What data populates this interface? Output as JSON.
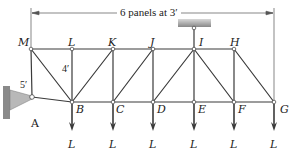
{
  "figure": {
    "type": "truss",
    "dimension_label": "6 panels at 3′",
    "panel_height_label": "4′",
    "left_height_label": "5′",
    "load_label": "L",
    "colors": {
      "member": "#3a3a3a",
      "support": "#9a9a9a",
      "background": "#ffffff"
    }
  },
  "nodes": {
    "M": {
      "label": "M",
      "x": 31,
      "y": 49
    },
    "L": {
      "label": "L",
      "x": 72,
      "y": 49
    },
    "K": {
      "label": "K",
      "x": 113,
      "y": 49
    },
    "J": {
      "label": "J",
      "x": 153,
      "y": 49
    },
    "I": {
      "label": "I",
      "x": 194,
      "y": 49
    },
    "H": {
      "label": "H",
      "x": 234,
      "y": 49
    },
    "A": {
      "label": "A",
      "x": 32,
      "y": 97
    },
    "B": {
      "label": "B",
      "x": 72,
      "y": 102
    },
    "C": {
      "label": "C",
      "x": 113,
      "y": 102
    },
    "D": {
      "label": "D",
      "x": 153,
      "y": 102
    },
    "E": {
      "label": "E",
      "x": 194,
      "y": 102
    },
    "F": {
      "label": "F",
      "x": 234,
      "y": 102
    },
    "G": {
      "label": "G",
      "x": 274,
      "y": 102
    }
  },
  "members": [
    [
      "M",
      "L"
    ],
    [
      "L",
      "K"
    ],
    [
      "K",
      "J"
    ],
    [
      "J",
      "I"
    ],
    [
      "I",
      "H"
    ],
    [
      "B",
      "C"
    ],
    [
      "C",
      "D"
    ],
    [
      "D",
      "E"
    ],
    [
      "E",
      "F"
    ],
    [
      "F",
      "G"
    ],
    [
      "M",
      "A"
    ],
    [
      "A",
      "B"
    ],
    [
      "M",
      "B"
    ],
    [
      "L",
      "B"
    ],
    [
      "K",
      "B"
    ],
    [
      "K",
      "C"
    ],
    [
      "J",
      "C"
    ],
    [
      "J",
      "D"
    ],
    [
      "I",
      "D"
    ],
    [
      "I",
      "E"
    ],
    [
      "I",
      "F"
    ],
    [
      "H",
      "F"
    ],
    [
      "H",
      "G"
    ]
  ],
  "loads": [
    {
      "node": "B",
      "label": "L"
    },
    {
      "node": "C",
      "label": "L"
    },
    {
      "node": "D",
      "label": "L"
    },
    {
      "node": "E",
      "label": "L"
    },
    {
      "node": "F",
      "label": "L"
    },
    {
      "node": "G",
      "label": "L"
    }
  ]
}
